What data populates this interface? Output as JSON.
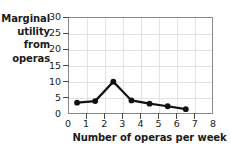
{
  "chart_data": {
    "type": "line",
    "title": "",
    "xlabel": "Number of operas per week",
    "ylabel": "Marginal utility from operas",
    "ylabel_lines": [
      "Marginal",
      "utility",
      "from",
      "operas"
    ],
    "x": [
      0.5,
      1.5,
      2.5,
      3.5,
      4.5,
      5.5,
      6.5
    ],
    "values": [
      3.5,
      4.0,
      10.0,
      4.2,
      3.2,
      2.4,
      1.5
    ],
    "xlim": [
      0,
      8
    ],
    "ylim": [
      0,
      30
    ],
    "xticks": [
      0,
      1,
      2,
      3,
      4,
      5,
      6,
      7,
      8
    ],
    "xtick_labels": [
      "0",
      "1",
      "2",
      "3",
      "4",
      "5",
      "6",
      "7",
      "8"
    ],
    "yticks": [
      0,
      5,
      10,
      15,
      20,
      25,
      30
    ],
    "ytick_labels": [
      "0",
      "5",
      "10",
      "15",
      "20",
      "25",
      "30"
    ],
    "grid": true,
    "legend": "none",
    "series_color": "#111111",
    "grid_color": "#e2e2e2",
    "frame_color": "#8a8a8a",
    "marker": "circle"
  }
}
